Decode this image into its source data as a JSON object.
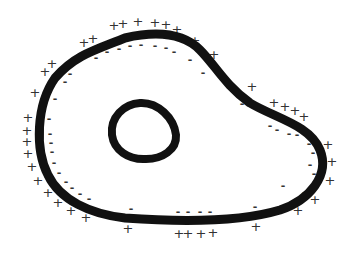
{
  "diagram": {
    "type": "cell membrane charge distribution",
    "colors": {
      "membrane": "#111111",
      "charge": "#333333",
      "background": "#ffffff"
    },
    "outer_membrane": {
      "path": "M 55 78 C 75 55, 95 50, 125 38 C 160 30, 185 35, 200 50 C 215 65, 225 85, 250 103 C 275 118, 310 125, 320 150 C 330 175, 310 200, 280 210 C 240 222, 180 222, 125 218 C 90 214, 60 200, 48 175 C 35 150, 36 105, 55 78 Z",
      "stroke_width": 9
    },
    "nucleus": {
      "path": "M 140 103 C 158 102, 174 118, 176 135 C 177 150, 162 159, 146 159 C 128 160, 114 150, 112 135 C 110 117, 124 104, 140 103 Z",
      "stroke_width": 8
    },
    "plus_symbol": "+",
    "minus_symbol": "-",
    "plus_charges": [
      [
        114,
        25
      ],
      [
        123,
        23
      ],
      [
        138,
        21
      ],
      [
        155,
        22
      ],
      [
        166,
        24
      ],
      [
        177,
        29
      ],
      [
        84,
        42
      ],
      [
        93,
        38
      ],
      [
        195,
        40
      ],
      [
        214,
        54
      ],
      [
        45,
        71
      ],
      [
        52,
        63
      ],
      [
        35,
        92
      ],
      [
        28,
        117
      ],
      [
        27,
        130
      ],
      [
        27,
        141
      ],
      [
        28,
        153
      ],
      [
        32,
        166
      ],
      [
        38,
        180
      ],
      [
        48,
        192
      ],
      [
        58,
        202
      ],
      [
        71,
        210
      ],
      [
        86,
        217
      ],
      [
        128,
        228
      ],
      [
        179,
        233
      ],
      [
        188,
        233
      ],
      [
        201,
        233
      ],
      [
        213,
        232
      ],
      [
        256,
        226
      ],
      [
        298,
        210
      ],
      [
        315,
        199
      ],
      [
        330,
        180
      ],
      [
        332,
        161
      ],
      [
        328,
        144
      ],
      [
        274,
        102
      ],
      [
        285,
        106
      ],
      [
        295,
        110
      ],
      [
        304,
        116
      ],
      [
        252,
        86
      ]
    ],
    "minus_charges": [
      [
        96,
        57
      ],
      [
        107,
        51
      ],
      [
        119,
        48
      ],
      [
        130,
        45
      ],
      [
        141,
        44
      ],
      [
        155,
        45
      ],
      [
        166,
        47
      ],
      [
        174,
        51
      ],
      [
        70,
        73
      ],
      [
        65,
        81
      ],
      [
        55,
        98
      ],
      [
        49,
        118
      ],
      [
        50,
        133
      ],
      [
        51,
        142
      ],
      [
        52,
        151
      ],
      [
        54,
        162
      ],
      [
        59,
        172
      ],
      [
        66,
        181
      ],
      [
        72,
        187
      ],
      [
        80,
        193
      ],
      [
        89,
        198
      ],
      [
        131,
        208
      ],
      [
        178,
        211
      ],
      [
        188,
        211
      ],
      [
        200,
        211
      ],
      [
        210,
        211
      ],
      [
        255,
        206
      ],
      [
        283,
        185
      ],
      [
        304,
        192
      ],
      [
        314,
        173
      ],
      [
        310,
        164
      ],
      [
        313,
        152
      ],
      [
        309,
        143
      ],
      [
        270,
        125
      ],
      [
        277,
        129
      ],
      [
        289,
        133
      ],
      [
        297,
        134
      ],
      [
        190,
        59
      ],
      [
        203,
        72
      ],
      [
        242,
        103
      ]
    ]
  }
}
